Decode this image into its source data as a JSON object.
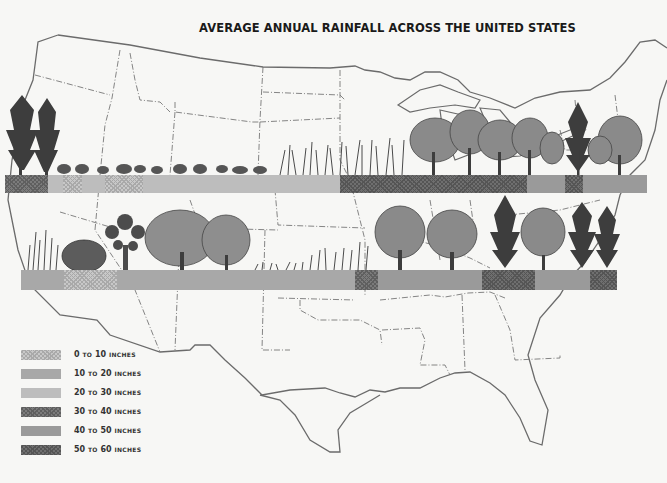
{
  "title": "AVERAGE ANNUAL RAINFALL ACROSS THE UNITED STATES",
  "legend": [
    {
      "num1": "0",
      "to": "TO",
      "num2": "10",
      "unit": "INCHES",
      "pattern": "p-stipple"
    },
    {
      "num1": "10",
      "to": "TO",
      "num2": "20",
      "unit": "INCHES",
      "pattern": "p-10-20"
    },
    {
      "num1": "20",
      "to": "TO",
      "num2": "30",
      "unit": "INCHES",
      "pattern": "p-20-30"
    },
    {
      "num1": "30",
      "to": "TO",
      "num2": "40",
      "unit": "INCHES",
      "pattern": "p-30-40"
    },
    {
      "num1": "40",
      "to": "TO",
      "num2": "50",
      "unit": "INCHES",
      "pattern": "p-40-50"
    },
    {
      "num1": "50",
      "to": "TO",
      "num2": "60",
      "unit": "INCHES",
      "pattern": "p-50-60"
    }
  ],
  "bands": [
    {
      "name": "northern-transect",
      "x": 5,
      "y": 175,
      "height": 18,
      "segments": [
        {
          "x0": 5,
          "x1": 48,
          "class": "30-40 inches"
        },
        {
          "x0": 48,
          "x1": 63,
          "class": "20-30 inches"
        },
        {
          "x0": 63,
          "x1": 82,
          "class": "0-10 inches"
        },
        {
          "x0": 82,
          "x1": 105,
          "class": "20-30 inches"
        },
        {
          "x0": 105,
          "x1": 143,
          "class": "0-10 inches"
        },
        {
          "x0": 143,
          "x1": 340,
          "class": "20-30 inches"
        },
        {
          "x0": 340,
          "x1": 527,
          "class": "50-60 inches"
        },
        {
          "x0": 527,
          "x1": 565,
          "class": "40-50 inches"
        },
        {
          "x0": 565,
          "x1": 583,
          "class": "50-60 inches"
        },
        {
          "x0": 583,
          "x1": 647,
          "class": "40-50 inches"
        }
      ],
      "vegetation": [
        "conifer trees",
        "sagebrush",
        "prairie grasses",
        "deciduous trees",
        "conifer",
        "deciduous trees"
      ]
    },
    {
      "name": "southern-transect",
      "x": 21,
      "y": 270,
      "height": 20,
      "segments": [
        {
          "x0": 21,
          "x1": 64,
          "class": "10-20 inches"
        },
        {
          "x0": 64,
          "x1": 117,
          "class": "0-10 inches"
        },
        {
          "x0": 117,
          "x1": 355,
          "class": "10-20 inches"
        },
        {
          "x0": 355,
          "x1": 378,
          "class": "30-40 inches"
        },
        {
          "x0": 378,
          "x1": 482,
          "class": "40-50 inches"
        },
        {
          "x0": 482,
          "x1": 535,
          "class": "50-60 inches"
        },
        {
          "x0": 535,
          "x1": 590,
          "class": "40-50 inches"
        },
        {
          "x0": 590,
          "x1": 617,
          "class": "50-60 inches"
        }
      ],
      "vegetation": [
        "grasses",
        "desert shrub",
        "joshua tree",
        "oak trees",
        "short grasses",
        "tall grasses",
        "deciduous trees",
        "pines",
        "deciduous tree",
        "pines"
      ]
    }
  ]
}
